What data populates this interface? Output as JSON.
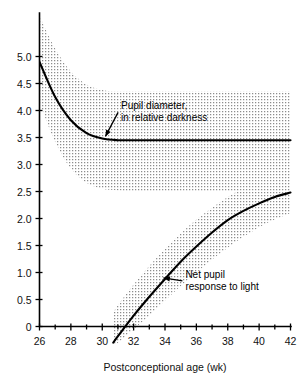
{
  "chart_data": {
    "type": "line",
    "title": "",
    "xlabel": "Postconceptional age (wk)",
    "ylabel": "",
    "xlim": [
      26,
      42
    ],
    "ylim": [
      -0.35,
      5.6
    ],
    "grid": false,
    "legend_position": "inline-annotations",
    "xticks": [
      26,
      28,
      30,
      32,
      34,
      36,
      38,
      40,
      42
    ],
    "xtick_labels": [
      "26",
      "28",
      "30",
      "32",
      "34",
      "36",
      "38",
      "40",
      "42"
    ],
    "xminor_ticks": [
      27,
      29,
      31,
      33,
      35,
      37,
      39,
      41
    ],
    "yticks": [
      0,
      0.5,
      1.0,
      1.5,
      2.0,
      2.5,
      3.0,
      3.5,
      4.0,
      4.5,
      5.0
    ],
    "ytick_labels": [
      "0",
      "0.5",
      "1.0",
      "1.5",
      "2.0",
      "2.5",
      "3.0",
      "3.5",
      "4.0",
      "4.5",
      "5.0"
    ],
    "series": [
      {
        "name": "Pupil diameter, in relative darkness",
        "x": [
          26,
          27,
          28,
          29,
          30,
          31,
          32,
          34,
          36,
          38,
          40,
          42
        ],
        "values": [
          4.9,
          4.25,
          3.82,
          3.58,
          3.48,
          3.45,
          3.45,
          3.45,
          3.45,
          3.45,
          3.45,
          3.45
        ],
        "band_upper": [
          5.75,
          5.15,
          4.72,
          4.48,
          4.38,
          4.35,
          4.35,
          4.35,
          4.35,
          4.35,
          4.35,
          4.35
        ],
        "band_lower": [
          4.15,
          3.42,
          2.92,
          2.66,
          2.55,
          2.52,
          2.5,
          2.5,
          2.5,
          2.5,
          2.5,
          2.5
        ]
      },
      {
        "name": "Net pupil response to light",
        "x": [
          30.7,
          31,
          32,
          33,
          34,
          35,
          36,
          37,
          38,
          39,
          40,
          41,
          42
        ],
        "values": [
          -0.3,
          -0.18,
          0.2,
          0.55,
          0.88,
          1.2,
          1.48,
          1.74,
          1.97,
          2.14,
          2.28,
          2.4,
          2.48
        ],
        "band_upper": [
          0.25,
          0.4,
          0.78,
          1.12,
          1.44,
          1.72,
          1.98,
          2.2,
          2.4,
          2.56,
          2.7,
          2.8,
          2.88
        ],
        "band_lower": [
          -0.35,
          -0.3,
          -0.05,
          0.2,
          0.48,
          0.75,
          1.0,
          1.24,
          1.46,
          1.66,
          1.84,
          1.98,
          2.1
        ]
      }
    ],
    "annotations": [
      {
        "id": "pupil-diameter-label",
        "lines": [
          "Pupil diameter,",
          "in relative darkness"
        ],
        "x": 31.2,
        "y": 4.02,
        "leader_to_x": 30.2,
        "leader_to_y": 3.52
      },
      {
        "id": "net-pupil-response-label",
        "lines": [
          "Net pupil",
          "response to light"
        ],
        "x": 35.3,
        "y": 0.9,
        "leader_to_x": 33.9,
        "leader_to_y": 0.9
      }
    ],
    "colors": {
      "curve": "#000000",
      "band": "#9a9a9a",
      "axis": "#000000",
      "background": "#ffffff"
    }
  }
}
